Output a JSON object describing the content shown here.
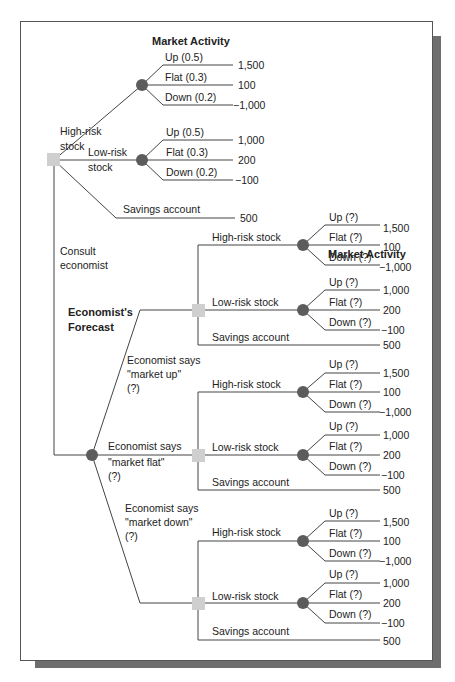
{
  "headers": {
    "market_activity_top": "Market Activity",
    "market_activity_right": "Market Activity",
    "economists_forecast_line1": "Economist's",
    "economists_forecast_line2": "Forecast"
  },
  "top_tree": {
    "high_risk": {
      "label_line1": "High-risk",
      "label_line2": "stock",
      "outcomes": [
        {
          "label": "Up (0.5)",
          "value": "1,500"
        },
        {
          "label": "Flat (0.3)",
          "value": "100"
        },
        {
          "label": "Down (0.2)",
          "value": "−1,000"
        }
      ]
    },
    "low_risk": {
      "label_line1": "Low-risk",
      "label_line2": "stock",
      "outcomes": [
        {
          "label": "Up (0.5)",
          "value": "1,000"
        },
        {
          "label": "Flat (0.3)",
          "value": "200"
        },
        {
          "label": "Down (0.2)",
          "value": "−100"
        }
      ]
    },
    "savings": {
      "label": "Savings account",
      "value": "500"
    },
    "consult": {
      "label_line1": "Consult",
      "label_line2": "economist"
    }
  },
  "forecast_branches": [
    {
      "label_line1": "Economist says",
      "label_line2": "\"market up\"",
      "label_line3": "(?)",
      "high_risk": {
        "label": "High-risk stock",
        "outcomes": [
          {
            "label": "Up (?)",
            "value": "1,500"
          },
          {
            "label": "Flat (?)",
            "value": "100"
          },
          {
            "label": "Down (?)",
            "value": "−1,000"
          }
        ]
      },
      "low_risk": {
        "label": "Low-risk stock",
        "outcomes": [
          {
            "label": "Up (?)",
            "value": "1,000"
          },
          {
            "label": "Flat (?)",
            "value": "200"
          },
          {
            "label": "Down (?)",
            "value": "−100"
          }
        ]
      },
      "savings": {
        "label": "Savings account",
        "value": "500"
      }
    },
    {
      "label_line1": "Economist says",
      "label_line2": "\"market flat\"",
      "label_line3": "(?)",
      "high_risk": {
        "label": "High-risk stock",
        "outcomes": [
          {
            "label": "Up (?)",
            "value": "1,500"
          },
          {
            "label": "Flat (?)",
            "value": "100"
          },
          {
            "label": "Down (?)",
            "value": "−1,000"
          }
        ]
      },
      "low_risk": {
        "label": "Low-risk stock",
        "outcomes": [
          {
            "label": "Up (?)",
            "value": "1,000"
          },
          {
            "label": "Flat (?)",
            "value": "200"
          },
          {
            "label": "Down (?)",
            "value": "−100"
          }
        ]
      },
      "savings": {
        "label": "Savings account",
        "value": "500"
      }
    },
    {
      "label_line1": "Economist says",
      "label_line2": "\"market down\"",
      "label_line3": "(?)",
      "high_risk": {
        "label": "High-risk stock",
        "outcomes": [
          {
            "label": "Up (?)",
            "value": "1,500"
          },
          {
            "label": "Flat (?)",
            "value": "100"
          },
          {
            "label": "Down (?)",
            "value": "−1,000"
          }
        ]
      },
      "low_risk": {
        "label": "Low-risk stock",
        "outcomes": [
          {
            "label": "Up (?)",
            "value": "1,000"
          },
          {
            "label": "Flat (?)",
            "value": "200"
          },
          {
            "label": "Down (?)",
            "value": "−100"
          }
        ]
      },
      "savings": {
        "label": "Savings account",
        "value": "500"
      }
    }
  ],
  "colors": {
    "chance_node": "#5c5c5c",
    "decision_node": "#cfcfcf",
    "line": "#444444",
    "shadow": "#6e6e6e"
  }
}
